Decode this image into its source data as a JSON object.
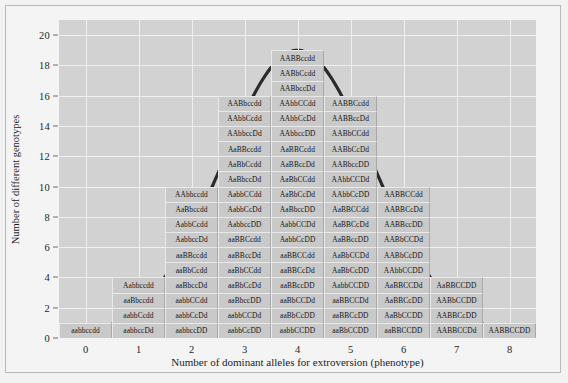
{
  "chart_data": {
    "type": "bar",
    "title": "",
    "xlabel": "Number of dominant alleles for extroversion (phenotype)",
    "ylabel": "Number of different genotypes",
    "xticks": [
      0,
      1,
      2,
      3,
      4,
      5,
      6,
      7,
      8
    ],
    "yticks": [
      0,
      2,
      4,
      6,
      8,
      10,
      12,
      14,
      16,
      18,
      20
    ],
    "xlim": [
      -0.5,
      8.5
    ],
    "ylim": [
      0,
      21
    ],
    "grid": true,
    "legend": "none",
    "categories": [
      "0",
      "1",
      "2",
      "3",
      "4",
      "5",
      "6",
      "7",
      "8"
    ],
    "values": [
      1,
      4,
      10,
      16,
      19,
      16,
      10,
      4,
      1
    ],
    "overlay_curve": "normal-distribution-bell-curve",
    "columns": [
      {
        "x": 0,
        "count": 1,
        "genotypes": [
          "aabbccdd"
        ]
      },
      {
        "x": 1,
        "count": 4,
        "genotypes": [
          "Aabbccdd",
          "aaBbccdd",
          "aabbCcdd",
          "aabbccDd"
        ]
      },
      {
        "x": 2,
        "count": 10,
        "genotypes": [
          "AAbbccdd",
          "AaBbccdd",
          "AabbCcdd",
          "AabbccDd",
          "aaBBccdd",
          "aaBbCcdd",
          "aaBbccDd",
          "aabbCCdd",
          "aabbCcDd",
          "aabbccDD"
        ]
      },
      {
        "x": 3,
        "count": 16,
        "genotypes": [
          "AABbccdd",
          "AAbbCcdd",
          "AAbbccDd",
          "AaBBccdd",
          "AaBbCcdd",
          "AaBbccDd",
          "AabbCCdd",
          "AabbCcDd",
          "AabbccDD",
          "aaBBCcdd",
          "aaBBccDd",
          "aaBbCCdd",
          "aaBbCcDd",
          "aaBbccDD",
          "aabbCCDd",
          "aabbCcDD"
        ]
      },
      {
        "x": 4,
        "count": 19,
        "genotypes": [
          "AABBccdd",
          "AABbCcdd",
          "AABbccDd",
          "AAbbCCdd",
          "AAbbCcDd",
          "AAbbccDD",
          "AaBBCcdd",
          "AaBBccDd",
          "AaBbCCdd",
          "AaBbCcDd",
          "AaBbccDD",
          "AabbCCDd",
          "AabbCcDD",
          "aaBBCCdd",
          "aaBBCcDd",
          "aaBBccDD",
          "aaBbCCDd",
          "aaBbCcDD",
          "aabbCCDD"
        ]
      },
      {
        "x": 5,
        "count": 16,
        "genotypes": [
          "AABBCcdd",
          "AABBccDd",
          "AABbCCdd",
          "AABbCcDd",
          "AABbccDD",
          "AAbbCCDd",
          "AAbbCcDD",
          "AaBBCCdd",
          "AaBBCcDd",
          "AaBBccDD",
          "AaBbCCDd",
          "AaBbCcDD",
          "AabbCCDD",
          "aaBBCCDd",
          "aaBBCcDD",
          "aaBbCCDD"
        ]
      },
      {
        "x": 6,
        "count": 10,
        "genotypes": [
          "AABBCCdd",
          "AABBCcDd",
          "AABBccDD",
          "AABbCCDd",
          "AABbCcDD",
          "AAbbCCDD",
          "AaBBCCDd",
          "AaBBCcDD",
          "AaBbCCDD",
          "aaBBCCDD"
        ]
      },
      {
        "x": 7,
        "count": 4,
        "genotypes": [
          "AaBBCCDD",
          "AABbCCDD",
          "AABBCcDD",
          "AABBCCDd"
        ]
      },
      {
        "x": 8,
        "count": 1,
        "genotypes": [
          "AABBCCDD"
        ]
      }
    ]
  }
}
